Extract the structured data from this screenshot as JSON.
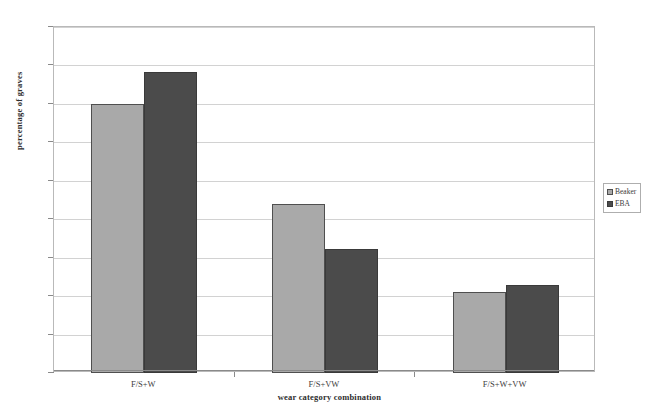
{
  "chart_data": {
    "type": "bar",
    "title": "",
    "xlabel": "wear category combination",
    "ylabel": "percentage of graves",
    "categories": [
      "F/S+W",
      "F/S+VW",
      "F/S+W+VW"
    ],
    "series": [
      {
        "name": "Beaker",
        "values": [
          35.0,
          22.0,
          10.5
        ],
        "color": "#a9a9a9"
      },
      {
        "name": "EBA",
        "values": [
          39.2,
          16.1,
          11.5
        ],
        "color": "#4b4b4b"
      }
    ],
    "ylim": [
      0,
      45
    ],
    "ytick_labels": [
      "0%",
      "5%",
      "10%",
      "15%",
      "20%",
      "25%",
      "30%",
      "35%",
      "40%",
      "45%"
    ],
    "ytick_values": [
      0,
      5,
      10,
      15,
      20,
      25,
      30,
      35,
      40,
      45
    ],
    "grid": true,
    "legend_position": "right"
  },
  "legend": {
    "entries": [
      {
        "label": "Beaker"
      },
      {
        "label": "EBA"
      }
    ]
  },
  "caption": {
    "sliver_text": ""
  }
}
